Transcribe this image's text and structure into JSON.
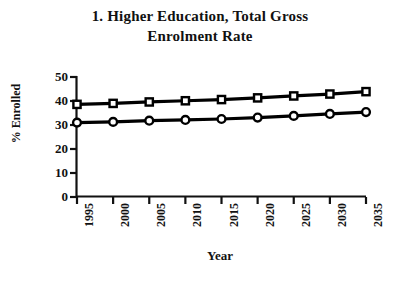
{
  "chart_data": {
    "type": "line",
    "title": "1. Higher Education, Total Gross Enrolment Rate",
    "title_line1": "1. Higher Education, Total Gross",
    "title_line2": "Enrolment Rate",
    "xlabel": "Year",
    "ylabel": "% Enrolled",
    "x": [
      1995,
      2000,
      2005,
      2010,
      2015,
      2020,
      2025,
      2030,
      2035
    ],
    "xtick_labels": [
      "1995",
      "2000",
      "2005",
      "2010",
      "2015",
      "2020",
      "2025",
      "2030",
      "2035"
    ],
    "ytick_labels": [
      "0",
      "10",
      "20",
      "30",
      "40",
      "50"
    ],
    "yticks": [
      0,
      10,
      20,
      30,
      40,
      50
    ],
    "ylim": [
      0,
      50
    ],
    "xlim": [
      1995,
      2035
    ],
    "grid": false,
    "legend": "none",
    "series": [
      {
        "name": "Total Gross Enrolment Rate (squares)",
        "marker": "square",
        "color": "#000000",
        "values": [
          38.6,
          39.0,
          39.6,
          40.1,
          40.6,
          41.3,
          42.1,
          42.9,
          43.9
        ]
      },
      {
        "name": "Total Gross Enrolment Rate (circles)",
        "marker": "circle",
        "color": "#000000",
        "values": [
          31.0,
          31.3,
          31.8,
          32.1,
          32.5,
          33.1,
          33.8,
          34.6,
          35.4
        ]
      }
    ]
  }
}
